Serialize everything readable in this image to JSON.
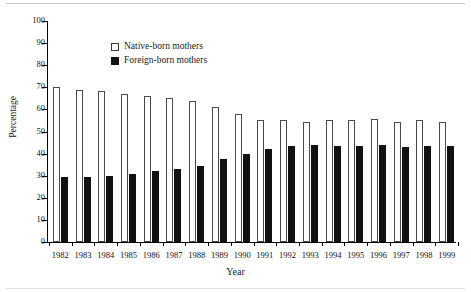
{
  "chart_data": {
    "type": "bar",
    "title": "",
    "xlabel": "Year",
    "ylabel": "Percentage",
    "categories": [
      "1982",
      "1983",
      "1984",
      "1985",
      "1986",
      "1987",
      "1988",
      "1989",
      "1990",
      "1991",
      "1992",
      "1993",
      "1994",
      "1995",
      "1996",
      "1997",
      "1998",
      "1999"
    ],
    "series": [
      {
        "name": "Native-born mothers",
        "color": "#ffffff",
        "edge_color": "#4a4a4a",
        "values": [
          70,
          69,
          68.5,
          67,
          66,
          65,
          64,
          61,
          58,
          55,
          55,
          54.5,
          55,
          55,
          55.5,
          54.5,
          55,
          54.5
        ]
      },
      {
        "name": "Foreign-born mothers",
        "color": "#111111",
        "edge_color": "#111111",
        "values": [
          29.5,
          29.5,
          30,
          31,
          32,
          33,
          34.5,
          37.5,
          40,
          42,
          43.5,
          44,
          43.5,
          43.5,
          44,
          43,
          43.5,
          43.5
        ]
      }
    ],
    "ylim": [
      0,
      100
    ],
    "yticks": [
      0,
      10,
      20,
      30,
      40,
      50,
      60,
      70,
      80,
      90,
      100
    ],
    "grid": false,
    "legend_position": "upper-center-left"
  },
  "legend": {
    "entries": [
      {
        "label": "Native-born mothers",
        "swatch": "open-square"
      },
      {
        "label": "Foreign-born mothers",
        "swatch": "filled-square"
      }
    ]
  }
}
